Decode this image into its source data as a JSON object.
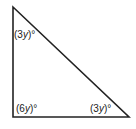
{
  "diagram": {
    "type": "triangle",
    "vertices": {
      "top": [
        13,
        7
      ],
      "bottom_left": [
        13,
        117
      ],
      "bottom_right": [
        129,
        117
      ]
    },
    "angles": [
      {
        "vertex": "top",
        "label_prefix": "(3",
        "variable": "y",
        "label_suffix": ")°"
      },
      {
        "vertex": "bottom_left",
        "label_prefix": "(6",
        "variable": "y",
        "label_suffix": ")°"
      },
      {
        "vertex": "bottom_right",
        "label_prefix": "(3",
        "variable": "y",
        "label_suffix": ")°"
      }
    ],
    "stroke_color": "#222222"
  }
}
